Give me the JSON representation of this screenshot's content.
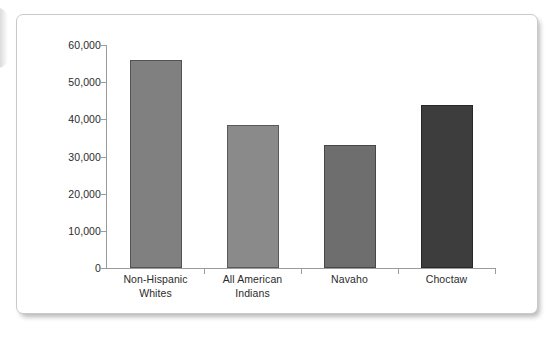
{
  "chart_data": {
    "type": "bar",
    "title": "",
    "subtitle": "",
    "xlabel": "",
    "ylabel": "",
    "categories": [
      "Non-Hispanic Whites",
      "All American Indians",
      "Navaho",
      "Choctaw"
    ],
    "category_lines": [
      [
        "Non-Hispanic",
        "Whites"
      ],
      [
        "All American",
        "Indians"
      ],
      [
        "Navaho",
        ""
      ],
      [
        "Choctaw",
        ""
      ]
    ],
    "values": [
      56000,
      38500,
      33000,
      43800
    ],
    "bar_colors": [
      "#808080",
      "#8a8a8a",
      "#6e6e6e",
      "#3d3d3d"
    ],
    "ylim": [
      0,
      60000
    ],
    "yticks": [
      0,
      10000,
      20000,
      30000,
      40000,
      50000,
      60000
    ],
    "ytick_labels": [
      "0",
      "10,000",
      "20,000",
      "30,000",
      "40,000",
      "50,000",
      "60,000"
    ],
    "grid": false,
    "legend": null,
    "legend_position": "none",
    "annotations": []
  },
  "panel": {
    "background_color": "#ffffff",
    "border_color": "#c9c9c9",
    "axis_color": "#9b9b9b",
    "text_color": "#2b2b2b"
  }
}
